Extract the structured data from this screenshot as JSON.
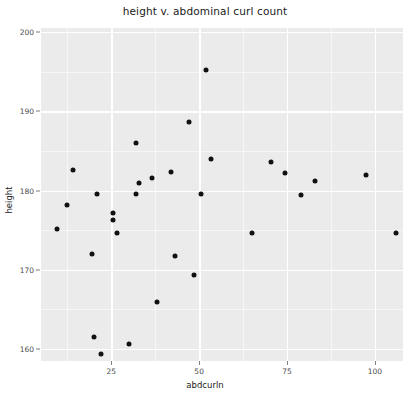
{
  "chart_data": {
    "type": "scatter",
    "title": "height v. abdominal curl count",
    "xlabel": "abdcurln",
    "ylabel": "height",
    "xlim": [
      5,
      108
    ],
    "ylim": [
      158.5,
      200.5
    ],
    "xticks": [
      25,
      50,
      75,
      100
    ],
    "xtick_labels": [
      "25",
      "50",
      "75",
      "100"
    ],
    "yticks": [
      160,
      170,
      180,
      190,
      200
    ],
    "ytick_labels": [
      "160",
      "170",
      "180",
      "190",
      "200"
    ],
    "grid": true,
    "legend": null,
    "panel_color": "#ebebeb",
    "grid_color": "#ffffff",
    "point_color": "#111111",
    "points": [
      {
        "x": 52.0,
        "y": 195.2
      },
      {
        "x": 47.0,
        "y": 188.6
      },
      {
        "x": 32.0,
        "y": 186.0
      },
      {
        "x": 53.5,
        "y": 184.0
      },
      {
        "x": 70.5,
        "y": 183.6
      },
      {
        "x": 14.0,
        "y": 182.6
      },
      {
        "x": 42.0,
        "y": 182.4
      },
      {
        "x": 74.5,
        "y": 182.2
      },
      {
        "x": 36.5,
        "y": 181.6
      },
      {
        "x": 97.5,
        "y": 182.0
      },
      {
        "x": 33.0,
        "y": 181.0
      },
      {
        "x": 83.0,
        "y": 181.2
      },
      {
        "x": 32.0,
        "y": 179.6
      },
      {
        "x": 21.0,
        "y": 179.6
      },
      {
        "x": 50.5,
        "y": 179.6
      },
      {
        "x": 79.0,
        "y": 179.4
      },
      {
        "x": 12.5,
        "y": 178.2
      },
      {
        "x": 25.5,
        "y": 177.2
      },
      {
        "x": 25.5,
        "y": 176.3
      },
      {
        "x": 9.5,
        "y": 175.2
      },
      {
        "x": 26.5,
        "y": 174.6
      },
      {
        "x": 65.0,
        "y": 174.6
      },
      {
        "x": 106.0,
        "y": 174.6
      },
      {
        "x": 19.5,
        "y": 172.0
      },
      {
        "x": 43.0,
        "y": 171.8
      },
      {
        "x": 48.5,
        "y": 169.4
      },
      {
        "x": 38.0,
        "y": 166.0
      },
      {
        "x": 20.0,
        "y": 161.5
      },
      {
        "x": 30.0,
        "y": 160.6
      },
      {
        "x": 22.0,
        "y": 159.4
      }
    ]
  }
}
